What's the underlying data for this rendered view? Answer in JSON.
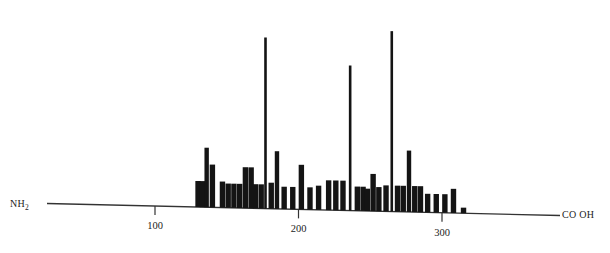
{
  "figure": {
    "nterm_label": "NH",
    "nterm_sub": "2",
    "cterm_label": "CO OH",
    "axis_color": "#333333",
    "peak_color": "#141414"
  },
  "chart_data": {
    "type": "bar",
    "title": "",
    "subtitle": "",
    "xlabel": "",
    "ylabel": "",
    "xlim": [
      0,
      355
    ],
    "ylim": [
      0,
      100
    ],
    "grid": false,
    "legend": null,
    "axis_ticks": [
      {
        "value": 100,
        "label": "100"
      },
      {
        "value": 200,
        "label": "200"
      },
      {
        "value": 300,
        "label": "300"
      }
    ],
    "terminus_labels": {
      "left": "NH2",
      "right": "CO OH"
    },
    "x": [
      130,
      133,
      136,
      140,
      147,
      151,
      155,
      159,
      163,
      167,
      170,
      174,
      177,
      181,
      185,
      190,
      196,
      202,
      208,
      214,
      221,
      226,
      231,
      236,
      241,
      245,
      248,
      252,
      256,
      261,
      265,
      269,
      273,
      277,
      281,
      285,
      290,
      296,
      302,
      308,
      315
    ],
    "values": [
      14,
      14,
      32,
      23,
      14,
      13,
      13,
      13,
      22,
      22,
      13,
      13,
      92,
      14,
      31,
      12,
      12,
      24,
      12,
      13,
      16,
      16,
      16,
      78,
      13,
      13,
      12,
      20,
      13,
      14,
      97,
      14,
      14,
      33,
      14,
      14,
      10,
      10,
      10,
      13,
      3
    ],
    "max_value": 97
  }
}
